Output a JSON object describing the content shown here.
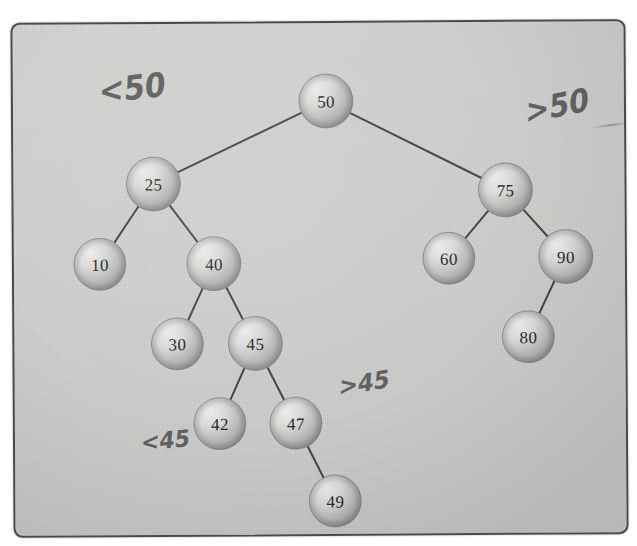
{
  "diagram": {
    "medium": "hand-drawn pencil sketch on grey paper",
    "paper_color": "#d2d2d0",
    "border_color": "#4a4a4c",
    "node_fill_light": "#e2e2e0",
    "node_fill_dark": "#9c9c9a",
    "edge_color": "#3a3a3c",
    "text_color": "#2b2b2d",
    "annotation_color": "#4a4a4c"
  },
  "nodes": [
    {
      "id": "n50",
      "label": "50",
      "x": 313,
      "y": 78,
      "r": 27
    },
    {
      "id": "n25",
      "label": "25",
      "x": 140,
      "y": 160,
      "r": 27
    },
    {
      "id": "n75",
      "label": "75",
      "x": 492,
      "y": 168,
      "r": 27
    },
    {
      "id": "n10",
      "label": "10",
      "x": 86,
      "y": 240,
      "r": 26
    },
    {
      "id": "n40",
      "label": "40",
      "x": 200,
      "y": 240,
      "r": 27
    },
    {
      "id": "n60",
      "label": "60",
      "x": 435,
      "y": 236,
      "r": 26
    },
    {
      "id": "n90",
      "label": "90",
      "x": 552,
      "y": 235,
      "r": 27
    },
    {
      "id": "n30",
      "label": "30",
      "x": 163,
      "y": 320,
      "r": 26
    },
    {
      "id": "n45",
      "label": "45",
      "x": 241,
      "y": 320,
      "r": 27
    },
    {
      "id": "n80",
      "label": "80",
      "x": 514,
      "y": 315,
      "r": 26
    },
    {
      "id": "n42",
      "label": "42",
      "x": 205,
      "y": 400,
      "r": 26
    },
    {
      "id": "n47",
      "label": "47",
      "x": 281,
      "y": 400,
      "r": 26
    },
    {
      "id": "n49",
      "label": "49",
      "x": 320,
      "y": 478,
      "r": 26
    }
  ],
  "edges": [
    {
      "from": "n50",
      "to": "n25"
    },
    {
      "from": "n50",
      "to": "n75"
    },
    {
      "from": "n25",
      "to": "n10"
    },
    {
      "from": "n25",
      "to": "n40"
    },
    {
      "from": "n75",
      "to": "n60"
    },
    {
      "from": "n75",
      "to": "n90"
    },
    {
      "from": "n40",
      "to": "n30"
    },
    {
      "from": "n40",
      "to": "n45"
    },
    {
      "from": "n90",
      "to": "n80"
    },
    {
      "from": "n45",
      "to": "n42"
    },
    {
      "from": "n45",
      "to": "n47"
    },
    {
      "from": "n47",
      "to": "n49"
    }
  ],
  "annotations": [
    {
      "id": "a1",
      "text": "<50",
      "describes": "left-subtree-of-root"
    },
    {
      "id": "a2",
      "text": ">50",
      "describes": "right-subtree-of-root"
    },
    {
      "id": "a3",
      "text": ">45",
      "describes": "right-subtree-of-45"
    },
    {
      "id": "a4",
      "text": "<45",
      "describes": "left-subtree-of-45"
    }
  ]
}
